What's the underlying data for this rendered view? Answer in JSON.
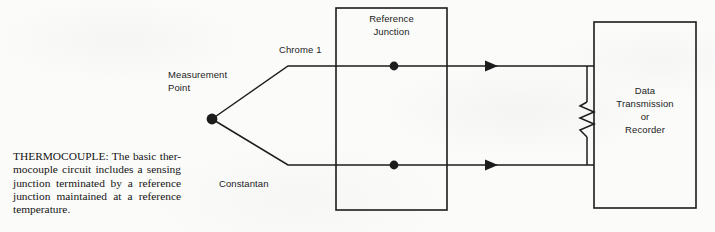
{
  "figure": {
    "name": "thermocouple-circuit-diagram",
    "caption": "THERMOCOUPLE: The basic ther-\nmocouple circuit includes a sensing\njunction terminated by a reference\njunction maintained at a reference\ntemperature.",
    "background_color": "#fbfbfa",
    "line_color": "#1c1c1c"
  },
  "labels": {
    "measurement_point": "Measurement\nPoint",
    "chromel_wire": "Chrome 1",
    "constantan_wire": "Constantan",
    "reference_junction": "Reference\nJunction",
    "data_recorder": "Data\nTransmission\nor\nRecorder"
  },
  "icons": {
    "measurement_junction_dot": "filled-circle-icon",
    "reference_junction_dot_top": "filled-circle-icon",
    "reference_junction_dot_bottom": "filled-circle-icon",
    "resistor": "resistor-zigzag-icon",
    "current_arrow_top": "arrowhead-right-icon",
    "current_arrow_bottom": "arrowhead-right-icon"
  },
  "geometry": {
    "measurement_point": {
      "x": 212,
      "y": 119
    },
    "reference_junction_box": {
      "x": 336,
      "y": 8,
      "w": 111,
      "h": 202
    },
    "data_recorder_box": {
      "x": 594,
      "y": 22,
      "w": 102,
      "h": 186
    },
    "top_wire_y": 66,
    "bottom_wire_y": 165,
    "resistor_branch_x": 587
  }
}
